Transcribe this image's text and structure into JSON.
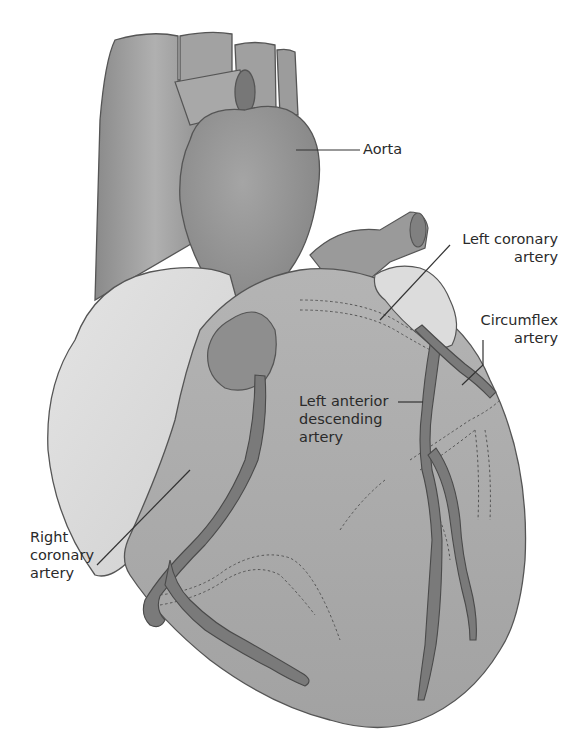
{
  "diagram": {
    "colors": {
      "background": "#ffffff",
      "vessel_dark": "#7a7a7a",
      "vessel_mid": "#9a9a9a",
      "ventricle": "#a8a8a8",
      "atrium_light": "#d9d9d9",
      "artery": "#6b6b6b",
      "outline": "#4a4a4a",
      "label_text": "#2a2a2a"
    },
    "labels": {
      "aorta": {
        "lines": [
          "Aorta"
        ]
      },
      "left_coronary_artery": {
        "lines": [
          "Left coronary",
          "artery"
        ]
      },
      "circumflex_artery": {
        "lines": [
          "Circumflex",
          "artery"
        ]
      },
      "left_anterior_descending_artery": {
        "lines": [
          "Left anterior",
          "descending",
          "artery"
        ]
      },
      "right_coronary_artery": {
        "lines": [
          "Right",
          "coronary",
          "artery"
        ]
      }
    }
  }
}
